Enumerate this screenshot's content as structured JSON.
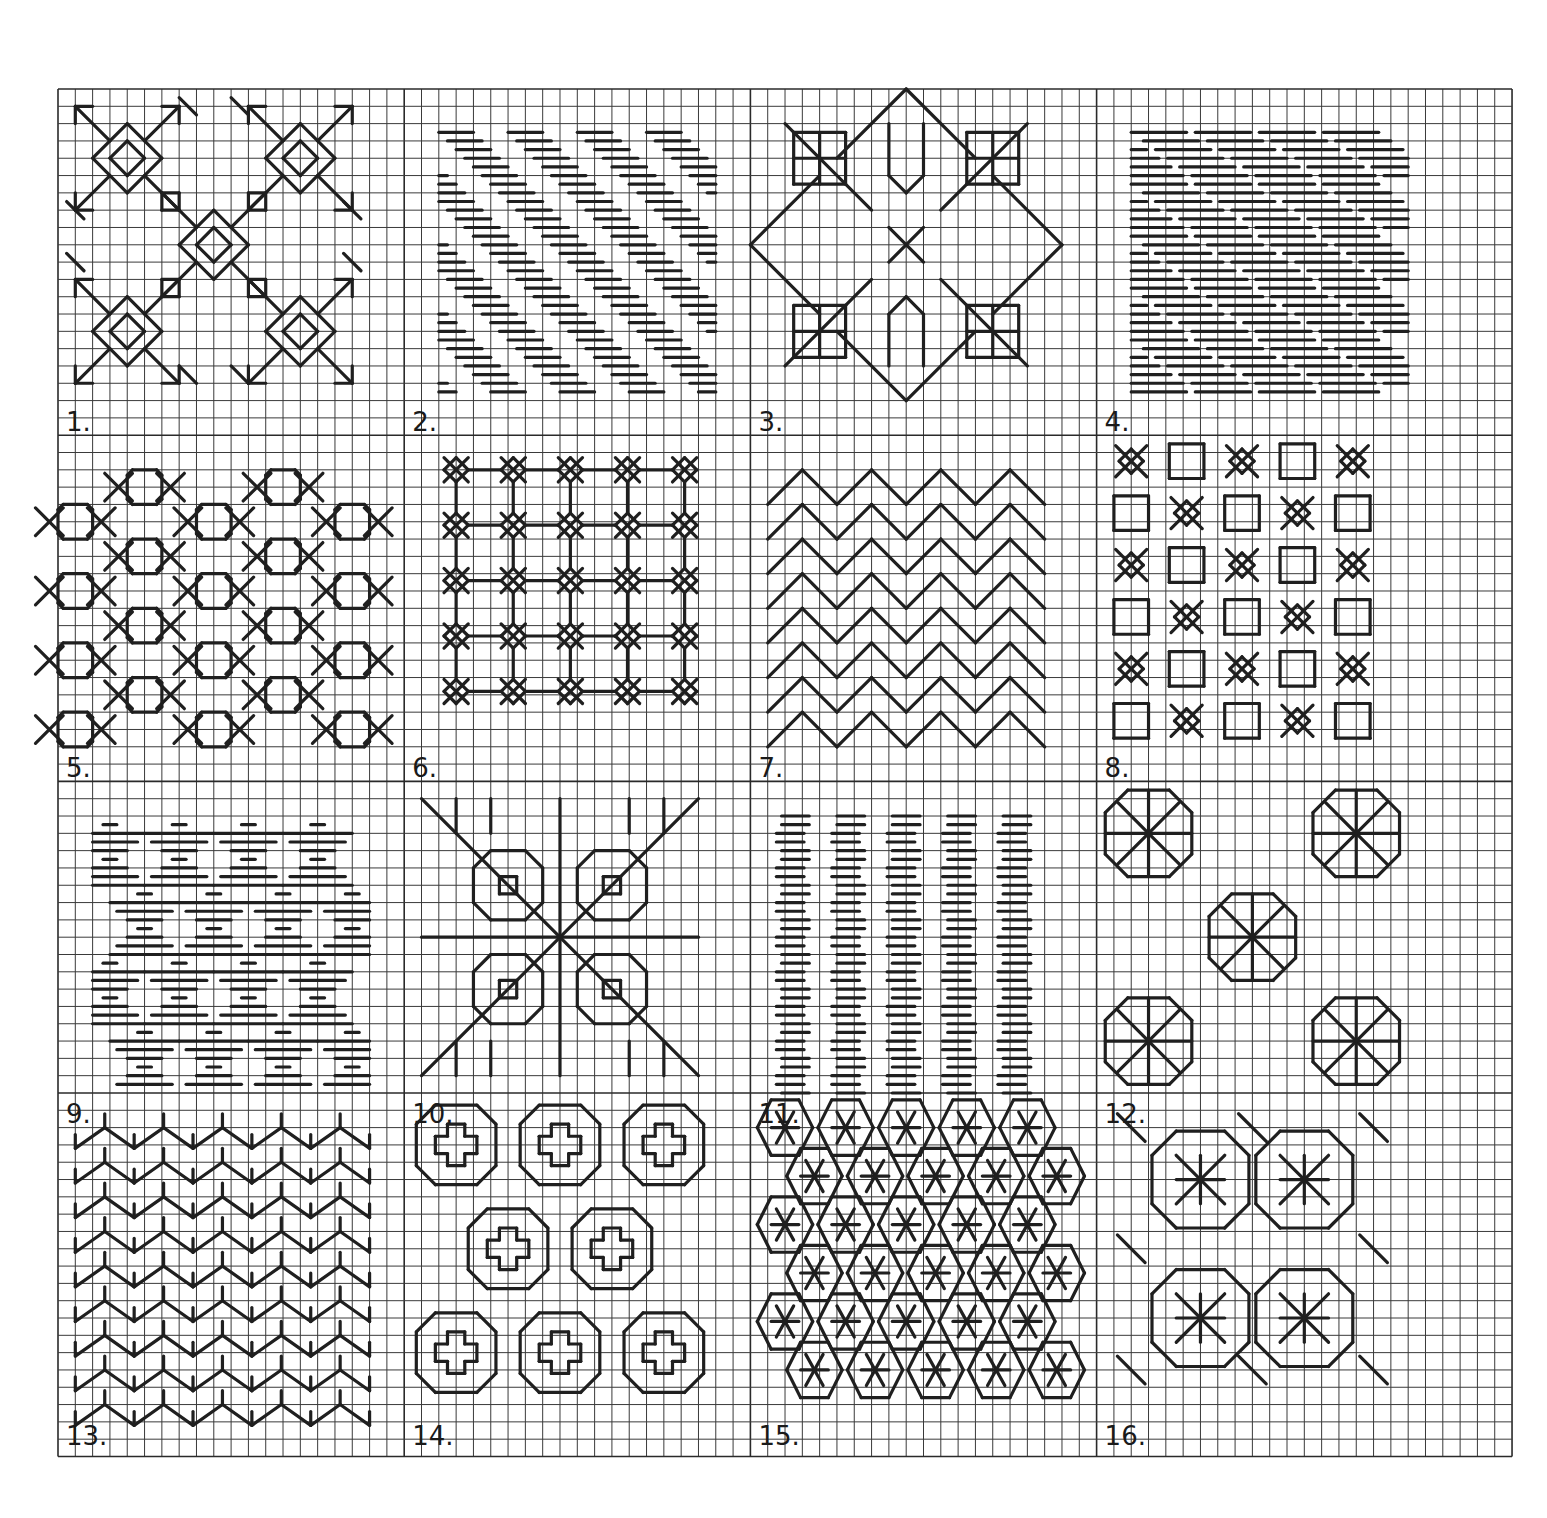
{
  "grid": {
    "left": 58,
    "top": 89,
    "cell": 17.31,
    "cols": 84,
    "rows": 79,
    "major_every_cols": 20,
    "major_col_offsets": [
      20,
      40,
      60
    ],
    "major_row_offsets": [
      20,
      40,
      58
    ],
    "line_color": "#3a3a3a",
    "stitch_color": "#1f1f1f"
  },
  "panels": [
    {
      "label": "1.",
      "col": 0,
      "row": 0,
      "type": "flower_diamond"
    },
    {
      "label": "2.",
      "col": 20,
      "row": 0,
      "type": "diag_dashes"
    },
    {
      "label": "3.",
      "col": 40,
      "row": 0,
      "type": "square_cross"
    },
    {
      "label": "4.",
      "col": 60,
      "row": 0,
      "type": "dense_dashes"
    },
    {
      "label": "5.",
      "col": 0,
      "row": 20,
      "type": "hex_chain"
    },
    {
      "label": "6.",
      "col": 20,
      "row": 20,
      "type": "star_grid"
    },
    {
      "label": "7.",
      "col": 40,
      "row": 20,
      "type": "chevrons"
    },
    {
      "label": "8.",
      "col": 60,
      "row": 20,
      "type": "box_x"
    },
    {
      "label": "9.",
      "col": 0,
      "row": 40,
      "type": "dash_diamonds"
    },
    {
      "label": "10.",
      "col": 20,
      "row": 40,
      "type": "big_star"
    },
    {
      "label": "11.",
      "col": 40,
      "row": 40,
      "type": "col_dashes"
    },
    {
      "label": "12.",
      "col": 60,
      "row": 40,
      "type": "fan_flowers"
    },
    {
      "label": "13.",
      "col": 0,
      "row": 58,
      "type": "zigzag_v"
    },
    {
      "label": "14.",
      "col": 20,
      "row": 58,
      "type": "cross_oct"
    },
    {
      "label": "15.",
      "col": 40,
      "row": 58,
      "type": "hex_stars"
    },
    {
      "label": "16.",
      "col": 60,
      "row": 58,
      "type": "octagons"
    }
  ]
}
